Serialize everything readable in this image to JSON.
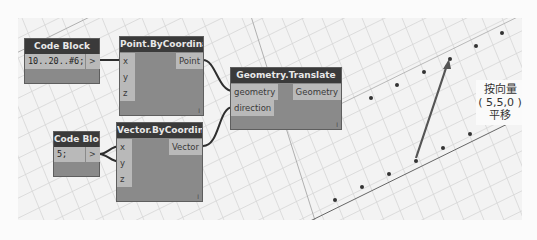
{
  "nodes": {
    "code_block_1": {
      "title": "Code Block",
      "code": "10..20..#6;",
      "output": ">"
    },
    "point_by_coordinates": {
      "title": "Point.ByCoordinates",
      "inputs": [
        "x",
        "y",
        "z"
      ],
      "output": "Point",
      "lacing": "l"
    },
    "code_block_2": {
      "title": "Code Block",
      "code": "5;",
      "output": ">"
    },
    "vector_by_coordinates": {
      "title": "Vector.ByCoordinates",
      "inputs": [
        "x",
        "y",
        "z"
      ],
      "output": "Vector",
      "lacing": "l"
    },
    "geometry_translate": {
      "title": "Geometry.Translate",
      "inputs": [
        "geometry",
        "direction"
      ],
      "output": "Geometry",
      "lacing": "l"
    }
  },
  "annotation": {
    "line1": "按向量",
    "line2": "( 5,5,0 )",
    "line3": "平移"
  },
  "colors": {
    "node_header": "#3a3a3a",
    "node_body": "#8a8a8a",
    "port": "#b9b9b9",
    "canvas": "#f3f3f3",
    "wire": "#333333"
  }
}
